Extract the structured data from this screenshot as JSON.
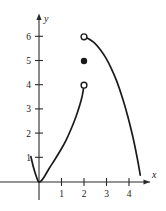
{
  "chart_data": {
    "type": "line",
    "title": "",
    "xlabel": "x",
    "ylabel": "y",
    "grid": false,
    "legend": false,
    "xlim": [
      -0.45,
      4.9
    ],
    "ylim": [
      -0.35,
      6.9
    ],
    "xticks": [
      1,
      2,
      3,
      4
    ],
    "yticks": [
      1,
      2,
      3,
      4,
      5,
      6
    ],
    "xtick_labels": [
      "1",
      "2",
      "3",
      "4"
    ],
    "ytick_labels": [
      "1",
      "2",
      "3",
      "4",
      "5",
      "6"
    ],
    "series": [
      {
        "name": "left-branch-parabola",
        "type": "line",
        "style": "solid",
        "color": "#1a1a1a",
        "points": [
          [
            -0.36,
            1.05
          ],
          [
            -0.25,
            0.62
          ],
          [
            -0.15,
            0.31
          ],
          [
            -0.05,
            0.06
          ],
          [
            0.0,
            0.0
          ],
          [
            0.1,
            0.05
          ],
          [
            0.25,
            0.24
          ],
          [
            0.45,
            0.56
          ],
          [
            0.7,
            0.92
          ],
          [
            0.95,
            1.3
          ],
          [
            1.2,
            1.72
          ],
          [
            1.45,
            2.24
          ],
          [
            1.65,
            2.72
          ],
          [
            1.82,
            3.2
          ],
          [
            1.93,
            3.6
          ],
          [
            2.0,
            4.0
          ]
        ]
      },
      {
        "name": "right-branch-concave-down",
        "type": "line",
        "style": "solid",
        "color": "#1a1a1a",
        "points": [
          [
            2.0,
            6.0
          ],
          [
            2.2,
            5.92
          ],
          [
            2.45,
            5.76
          ],
          [
            2.7,
            5.5
          ],
          [
            2.95,
            5.16
          ],
          [
            3.2,
            4.72
          ],
          [
            3.45,
            4.18
          ],
          [
            3.7,
            3.5
          ],
          [
            3.95,
            2.7
          ],
          [
            4.15,
            1.95
          ],
          [
            4.3,
            1.3
          ],
          [
            4.42,
            0.72
          ],
          [
            4.5,
            0.28
          ]
        ]
      }
    ],
    "markers": [
      {
        "name": "open-circle-upper",
        "x": 2,
        "y": 6,
        "fill": "open",
        "meaning": "right branch endpoint not included"
      },
      {
        "name": "closed-dot",
        "x": 2,
        "y": 5,
        "fill": "closed",
        "meaning": "function value at x = 2"
      },
      {
        "name": "open-circle-lower",
        "x": 2,
        "y": 4,
        "fill": "open",
        "meaning": "left branch endpoint not included"
      }
    ]
  },
  "axes": {
    "x_axis_label": "x",
    "y_axis_label": "y"
  }
}
